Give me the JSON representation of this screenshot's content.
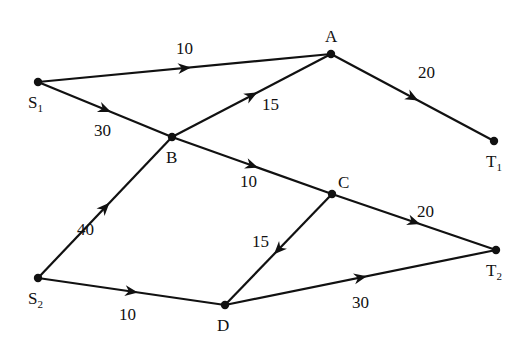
{
  "diagram": {
    "type": "directed-network",
    "nodes": [
      {
        "id": "S1",
        "label": "S",
        "sub": "1",
        "x": 38,
        "y": 82,
        "lx": 28,
        "ly": 108
      },
      {
        "id": "A",
        "label": "A",
        "sub": "",
        "x": 331,
        "y": 54,
        "lx": 325,
        "ly": 42
      },
      {
        "id": "T1",
        "label": "T",
        "sub": "1",
        "x": 494,
        "y": 141,
        "lx": 486,
        "ly": 167
      },
      {
        "id": "B",
        "label": "B",
        "sub": "",
        "x": 172,
        "y": 137,
        "lx": 166,
        "ly": 163
      },
      {
        "id": "C",
        "label": "C",
        "sub": "",
        "x": 332,
        "y": 194,
        "lx": 338,
        "ly": 188
      },
      {
        "id": "S2",
        "label": "S",
        "sub": "2",
        "x": 38,
        "y": 278,
        "lx": 28,
        "ly": 304
      },
      {
        "id": "D",
        "label": "D",
        "sub": "",
        "x": 225,
        "y": 305,
        "lx": 217,
        "ly": 331
      },
      {
        "id": "T2",
        "label": "T",
        "sub": "2",
        "x": 496,
        "y": 250,
        "lx": 486,
        "ly": 276
      }
    ],
    "edges": [
      {
        "from": "S1",
        "to": "A",
        "weight": "10",
        "wx": 176,
        "wy": 54
      },
      {
        "from": "S1",
        "to": "B",
        "weight": "30",
        "wx": 94,
        "wy": 136
      },
      {
        "from": "B",
        "to": "A",
        "weight": "15",
        "wx": 262,
        "wy": 110
      },
      {
        "from": "A",
        "to": "T1",
        "weight": "20",
        "wx": 418,
        "wy": 78
      },
      {
        "from": "B",
        "to": "C",
        "weight": "10",
        "wx": 240,
        "wy": 187
      },
      {
        "from": "S2",
        "to": "B",
        "weight": "40",
        "wx": 77,
        "wy": 235
      },
      {
        "from": "C",
        "to": "T2",
        "weight": "20",
        "wx": 417,
        "wy": 217
      },
      {
        "from": "C",
        "to": "D",
        "weight": "15",
        "wx": 252,
        "wy": 247
      },
      {
        "from": "S2",
        "to": "D",
        "weight": "10",
        "wx": 119,
        "wy": 320
      },
      {
        "from": "D",
        "to": "T2",
        "weight": "30",
        "wx": 352,
        "wy": 308
      }
    ]
  }
}
